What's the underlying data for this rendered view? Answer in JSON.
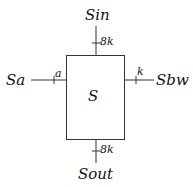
{
  "diagram": {
    "block": {
      "label": "S"
    },
    "ports": {
      "top": {
        "name": "Sin",
        "width": "8k"
      },
      "bottom": {
        "name": "Sout",
        "width": "8k"
      },
      "left": {
        "name": "Sa",
        "width": "a"
      },
      "right": {
        "name": "Sbw",
        "width": "k"
      }
    },
    "colors": {
      "stroke": "#333333",
      "text": "#111111",
      "background": "#ffffff"
    }
  }
}
